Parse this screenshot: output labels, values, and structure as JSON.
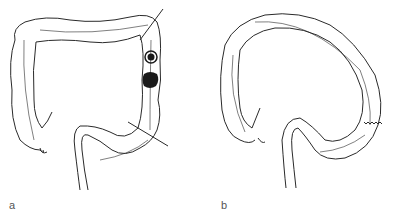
{
  "figure": {
    "panels": [
      {
        "label": "a",
        "description": "Colon with two lesions (polyp and tumor) in descending colon, resection lines marked"
      },
      {
        "label": "b",
        "description": "Colon after segmental resection with end-to-end anastomosis"
      }
    ],
    "colors": {
      "line": "#2a2a2a",
      "lesion": "#1a1a1a",
      "background": "#ffffff"
    }
  }
}
